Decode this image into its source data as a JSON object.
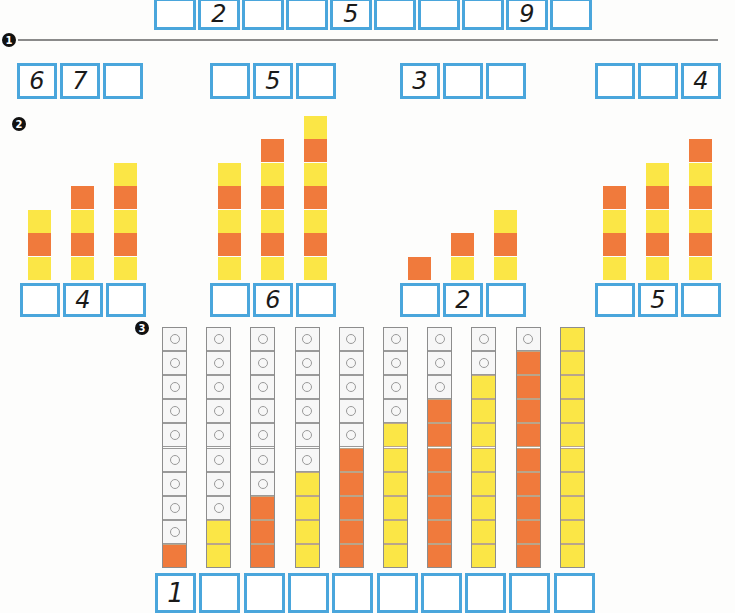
{
  "colors": {
    "box_border": "#4aa6dc",
    "orange": "#f07a3c",
    "yellow": "#fbe646",
    "gray_cube": "#f7f7f7"
  },
  "top_row": {
    "boxes": [
      "",
      "2",
      "",
      "",
      "5",
      "",
      "",
      "",
      "9",
      ""
    ]
  },
  "section1": {
    "badge": "1",
    "groups": [
      {
        "boxes": [
          "6",
          "7",
          ""
        ]
      },
      {
        "boxes": [
          "",
          "5",
          ""
        ]
      },
      {
        "boxes": [
          "3",
          "",
          ""
        ]
      },
      {
        "boxes": [
          "",
          "",
          "4"
        ]
      }
    ]
  },
  "section2": {
    "badge": "2",
    "groups": [
      {
        "towers": [
          [
            "y",
            "o",
            "y"
          ],
          [
            "y",
            "o",
            "y",
            "o"
          ],
          [
            "y",
            "o",
            "y",
            "o",
            "y"
          ]
        ],
        "boxes": [
          "",
          "4",
          ""
        ]
      },
      {
        "towers": [
          [
            "y",
            "o",
            "y",
            "o",
            "y"
          ],
          [
            "y",
            "o",
            "y",
            "o",
            "y",
            "o"
          ],
          [
            "y",
            "o",
            "y",
            "o",
            "y",
            "o",
            "y"
          ]
        ],
        "boxes": [
          "",
          "6",
          ""
        ]
      },
      {
        "towers": [
          [
            "o"
          ],
          [
            "y",
            "o"
          ],
          [
            "y",
            "o",
            "y"
          ]
        ],
        "boxes": [
          "",
          "2",
          ""
        ]
      },
      {
        "towers": [
          [
            "y",
            "o",
            "y",
            "o"
          ],
          [
            "y",
            "o",
            "y",
            "o",
            "y"
          ],
          [
            "y",
            "o",
            "y",
            "o",
            "y",
            "o"
          ]
        ],
        "boxes": [
          "",
          "5",
          ""
        ]
      }
    ]
  },
  "section3": {
    "badge": "3",
    "columns": [
      {
        "gray": 9,
        "colored": 1,
        "color": "o"
      },
      {
        "gray": 8,
        "colored": 2,
        "color": "y"
      },
      {
        "gray": 7,
        "colored": 3,
        "color": "o"
      },
      {
        "gray": 6,
        "colored": 4,
        "color": "y"
      },
      {
        "gray": 5,
        "colored": 5,
        "color": "o"
      },
      {
        "gray": 4,
        "colored": 6,
        "color": "y"
      },
      {
        "gray": 3,
        "colored": 7,
        "color": "o"
      },
      {
        "gray": 2,
        "colored": 8,
        "color": "y"
      },
      {
        "gray": 1,
        "colored": 9,
        "color": "o"
      },
      {
        "gray": 0,
        "colored": 10,
        "color": "y"
      }
    ],
    "boxes": [
      "1",
      "",
      "",
      "",
      "",
      "",
      "",
      "",
      "",
      ""
    ]
  }
}
